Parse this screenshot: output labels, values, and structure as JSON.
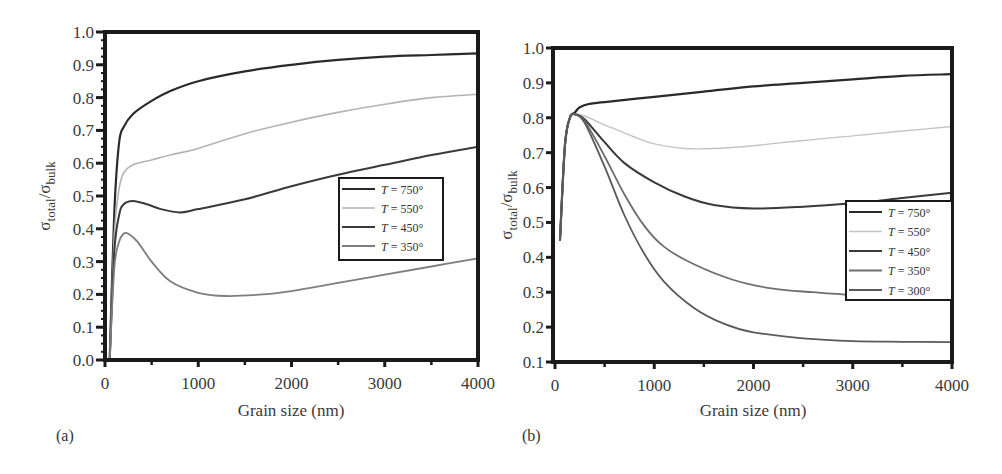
{
  "chart_data": [
    {
      "panel": "(a)",
      "type": "line",
      "xlabel": "Grain size (nm)",
      "ylabel": "σtotal/σbulk",
      "ylabel_main": "σ",
      "ylabel_sub1": "total",
      "ylabel_sep": "/σ",
      "ylabel_sub2": "bulk",
      "xlim": [
        0,
        4000
      ],
      "ylim": [
        0.0,
        1.0
      ],
      "xticks": [
        "0",
        "1000",
        "2000",
        "3000",
        "4000"
      ],
      "yticks": [
        "0.0",
        "0.1",
        "0.2",
        "0.3",
        "0.4",
        "0.5",
        "0.6",
        "0.7",
        "0.8",
        "0.9",
        "1.0"
      ],
      "grid": false,
      "legend_position": "center-right",
      "series": [
        {
          "name": "T = 750°",
          "label_T": "T",
          "label_rest": " = 750°",
          "color": "#2a2a2a",
          "width": 2.2,
          "x": [
            50,
            100,
            150,
            200,
            300,
            500,
            700,
            1000,
            1500,
            2000,
            2500,
            3000,
            3500,
            4000
          ],
          "y": [
            0.0,
            0.45,
            0.66,
            0.71,
            0.75,
            0.79,
            0.82,
            0.85,
            0.88,
            0.9,
            0.915,
            0.925,
            0.93,
            0.935
          ]
        },
        {
          "name": "T = 550°",
          "label_T": "T",
          "label_rest": " = 550°",
          "color": "#b4b4b4",
          "width": 1.6,
          "x": [
            50,
            100,
            150,
            200,
            300,
            500,
            700,
            1000,
            1500,
            2000,
            2500,
            3000,
            3500,
            4000
          ],
          "y": [
            0.0,
            0.38,
            0.52,
            0.57,
            0.595,
            0.61,
            0.625,
            0.645,
            0.69,
            0.725,
            0.755,
            0.78,
            0.8,
            0.81
          ]
        },
        {
          "name": "T = 450°",
          "label_T": "T",
          "label_rest": " = 450°",
          "color": "#3a3a3a",
          "width": 2.0,
          "x": [
            50,
            100,
            150,
            200,
            300,
            450,
            600,
            800,
            1000,
            1500,
            2000,
            2500,
            3000,
            3500,
            4000
          ],
          "y": [
            0.0,
            0.33,
            0.44,
            0.475,
            0.485,
            0.475,
            0.46,
            0.45,
            0.46,
            0.49,
            0.53,
            0.565,
            0.595,
            0.625,
            0.65
          ]
        },
        {
          "name": "T = 350°",
          "label_T": "T",
          "label_rest": " = 350°",
          "color": "#7e7e7e",
          "width": 1.8,
          "x": [
            50,
            100,
            150,
            200,
            250,
            350,
            500,
            700,
            1000,
            1300,
            1700,
            2000,
            2500,
            3000,
            3500,
            4000
          ],
          "y": [
            0.0,
            0.28,
            0.36,
            0.385,
            0.385,
            0.36,
            0.3,
            0.24,
            0.205,
            0.195,
            0.2,
            0.21,
            0.235,
            0.26,
            0.285,
            0.31
          ]
        }
      ]
    },
    {
      "panel": "(b)",
      "type": "line",
      "xlabel": "Grain size (nm)",
      "ylabel": "σtotal/σbulk",
      "ylabel_main": "σ",
      "ylabel_sub1": "total",
      "ylabel_sep": "/σ",
      "ylabel_sub2": "bulk",
      "xlim": [
        0,
        4000
      ],
      "ylim": [
        0.1,
        1.0
      ],
      "xticks": [
        "0",
        "1000",
        "2000",
        "3000",
        "4000"
      ],
      "yticks": [
        "0.1",
        "0.2",
        "0.3",
        "0.4",
        "0.5",
        "0.6",
        "0.7",
        "0.8",
        "0.9",
        "1.0"
      ],
      "grid": false,
      "legend_position": "lower-right",
      "series": [
        {
          "name": "T = 750°",
          "label_T": "T",
          "label_rest": " = 750°",
          "color": "#2a2a2a",
          "width": 2.2,
          "x": [
            50,
            100,
            150,
            200,
            250,
            350,
            500,
            1000,
            1500,
            2000,
            2500,
            3000,
            3500,
            4000
          ],
          "y": [
            0.45,
            0.72,
            0.8,
            0.815,
            0.83,
            0.84,
            0.845,
            0.86,
            0.875,
            0.89,
            0.9,
            0.91,
            0.92,
            0.925
          ]
        },
        {
          "name": "T = 550°",
          "label_T": "T",
          "label_rest": " = 550°",
          "color": "#c4c4c4",
          "width": 1.4,
          "x": [
            50,
            100,
            150,
            200,
            300,
            500,
            800,
            1000,
            1300,
            1600,
            2000,
            2500,
            3000,
            3500,
            4000
          ],
          "y": [
            0.45,
            0.72,
            0.8,
            0.81,
            0.805,
            0.78,
            0.745,
            0.725,
            0.712,
            0.712,
            0.72,
            0.735,
            0.748,
            0.762,
            0.775
          ]
        },
        {
          "name": "T = 450°",
          "label_T": "T",
          "label_rest": " = 450°",
          "color": "#3a3a3a",
          "width": 2.0,
          "x": [
            50,
            100,
            150,
            200,
            300,
            500,
            700,
            1000,
            1300,
            1600,
            2000,
            2500,
            3000,
            3500,
            4000
          ],
          "y": [
            0.45,
            0.72,
            0.8,
            0.81,
            0.795,
            0.73,
            0.67,
            0.615,
            0.575,
            0.55,
            0.54,
            0.545,
            0.555,
            0.57,
            0.585
          ]
        },
        {
          "name": "T = 350°",
          "label_T": "T",
          "label_rest": " = 350°",
          "color": "#6e6e6e",
          "width": 1.8,
          "x": [
            50,
            100,
            150,
            200,
            300,
            500,
            700,
            900,
            1100,
            1400,
            1800,
            2200,
            2600,
            3000,
            3500,
            4000
          ],
          "y": [
            0.45,
            0.72,
            0.8,
            0.81,
            0.79,
            0.69,
            0.58,
            0.49,
            0.43,
            0.38,
            0.335,
            0.31,
            0.3,
            0.292,
            0.288,
            0.285
          ]
        },
        {
          "name": "T = 300°",
          "label_T": "T",
          "label_rest": " = 300°",
          "color": "#5a5a5a",
          "width": 1.8,
          "x": [
            50,
            100,
            150,
            200,
            300,
            500,
            700,
            900,
            1100,
            1400,
            1700,
            2000,
            2500,
            3000,
            3500,
            4000
          ],
          "y": [
            0.45,
            0.72,
            0.8,
            0.81,
            0.785,
            0.66,
            0.52,
            0.41,
            0.33,
            0.255,
            0.21,
            0.185,
            0.168,
            0.16,
            0.158,
            0.157
          ]
        }
      ]
    }
  ]
}
